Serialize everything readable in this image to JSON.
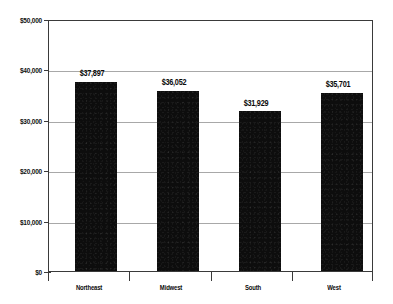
{
  "chart_data": {
    "type": "bar",
    "title": "",
    "subtitle": "",
    "xlabel": "",
    "ylabel": "",
    "categories": [
      "Northeast",
      "Midwest",
      "South",
      "West"
    ],
    "values": [
      37897,
      36052,
      31929,
      35701
    ],
    "data_labels": [
      "$37,897",
      "$36,052",
      "$31,929",
      "$35,701"
    ],
    "ylim": [
      0,
      50000
    ],
    "ytick_values": [
      50000,
      40000,
      30000,
      20000,
      10000,
      0
    ],
    "ytick_labels": [
      "$50,000",
      "$40,000",
      "$30,000",
      "$20,000",
      "$10,000",
      "$0"
    ],
    "grid": true,
    "grid_axis": "y",
    "legend": false,
    "legend_position": "none",
    "series": [
      {
        "name": "",
        "values": [
          37897,
          36052,
          31929,
          35701
        ]
      }
    ],
    "colors": {
      "bar": "#0d0d0d",
      "gridline": "#a8a8a8",
      "axis": "#3a3a3a",
      "text": "#0a0a0a",
      "background": "#ffffff"
    }
  }
}
